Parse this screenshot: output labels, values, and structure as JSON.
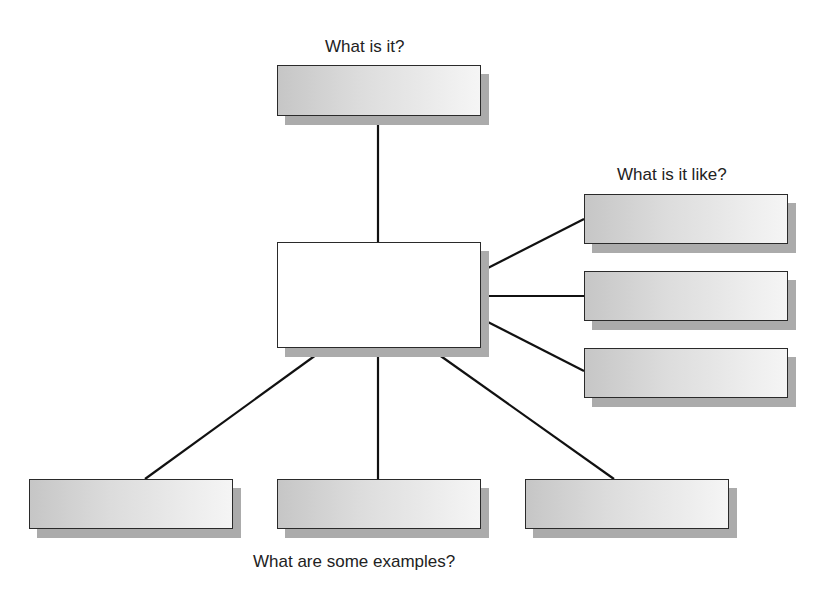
{
  "diagram": {
    "type": "concept-definition-map",
    "labels": {
      "top": "What is it?",
      "right": "What is it like?",
      "bottom": "What are some examples?"
    },
    "nodes": {
      "center": {
        "text": ""
      },
      "category": {
        "text": ""
      },
      "properties": [
        {
          "text": ""
        },
        {
          "text": ""
        },
        {
          "text": ""
        }
      ],
      "examples": [
        {
          "text": ""
        },
        {
          "text": ""
        },
        {
          "text": ""
        }
      ]
    },
    "colors": {
      "line": "#111111",
      "border": "#2a2a2a",
      "shadow": "#ababab",
      "box_fill_start": "#c6c6c6",
      "box_fill_end": "#f5f5f5",
      "center_fill": "#ffffff",
      "text": "#222222"
    }
  }
}
